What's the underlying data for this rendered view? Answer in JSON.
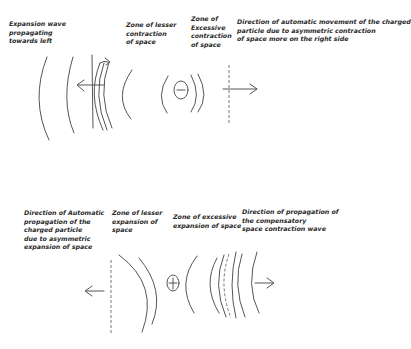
{
  "top_panel": {
    "label_expansion_wave": "Expansion wave\npropagating\ntowards left",
    "label_lesser_contraction": "Zone of lesser\ncontraction\nof space",
    "label_excessive_contraction": "Zone of\nExcessive\ncontraction\nof space",
    "label_direction": "Direction of automatic movement of the charged\nparticle due to asymmetric contraction\nof space more on the right side",
    "particle_symbol": "−"
  },
  "bottom_panel": {
    "label_direction": "Direction of Automatic\npropagation of the\ncharged particle\ndue to asymmetric\nexpansion of space",
    "label_lesser_expansion": "Zone of lesser\nexpansion of\nspace",
    "label_excessive_expansion": "Zone of excessive\nexpansion of space",
    "label_compensatory": "Direction of propagation of\nthe compensatory\nspace contraction wave",
    "particle_symbol": "+"
  }
}
